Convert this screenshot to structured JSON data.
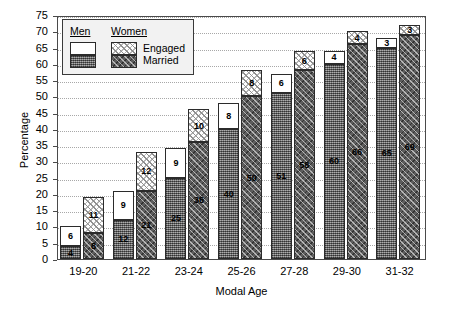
{
  "chart_data": {
    "type": "bar",
    "title": "",
    "xlabel": "Modal Age",
    "ylabel": "Percentage",
    "categories": [
      "19-20",
      "21-22",
      "23-24",
      "25-26",
      "27-28",
      "29-30",
      "31-32"
    ],
    "ylim": [
      0,
      75
    ],
    "ytick_step": 5,
    "yticks": [
      0,
      5,
      10,
      15,
      20,
      25,
      30,
      35,
      40,
      45,
      50,
      55,
      60,
      65,
      70,
      75
    ],
    "grid": true,
    "stacked": true,
    "legend_position": "top-left",
    "series": [
      {
        "name": "Men Married",
        "group": "Men",
        "status": "Married",
        "values": [
          4,
          12,
          25,
          40,
          51,
          60,
          65
        ]
      },
      {
        "name": "Men Engaged",
        "group": "Men",
        "status": "Engaged",
        "values": [
          6,
          9,
          9,
          8,
          6,
          4,
          3
        ]
      },
      {
        "name": "Women Married",
        "group": "Women",
        "status": "Married",
        "values": [
          8,
          21,
          36,
          50,
          58,
          66,
          69
        ]
      },
      {
        "name": "Women Engaged",
        "group": "Women",
        "status": "Engaged",
        "values": [
          11,
          12,
          10,
          8,
          6,
          4,
          3
        ]
      }
    ],
    "totals": {
      "men": [
        10,
        21,
        34,
        48,
        57,
        64,
        68
      ],
      "women": [
        19,
        33,
        46,
        58,
        64,
        70,
        72
      ]
    }
  },
  "legend": {
    "header_men": "Men",
    "header_women": "Women",
    "label_engaged": "Engaged",
    "label_married": "Married"
  },
  "axes": {
    "ylabel": "Percentage",
    "xlabel": "Modal Age"
  },
  "colors": {
    "men_engaged": "#ffffff",
    "men_married": "#767676",
    "women_engaged": "#e8e8e8",
    "women_married": "#5d5d5d",
    "grid": "#a8a8a8",
    "frame": "#4a4a4a",
    "legend_bg": "#f2f2f2"
  }
}
